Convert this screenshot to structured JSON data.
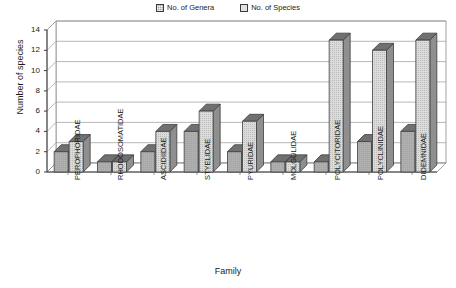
{
  "chart_data": {
    "type": "bar",
    "title": "",
    "xlabel": "Family",
    "ylabel": "Number of species",
    "ylim": [
      0,
      14
    ],
    "ytick_step": 2,
    "yticks": [
      0,
      2,
      4,
      6,
      8,
      10,
      12,
      14
    ],
    "grid": true,
    "three_d": true,
    "legend_position": "top-right",
    "categories": [
      "PEROPHORIDAE",
      "RHODOSOMATIDAE",
      "ASCIDIIDAE",
      "STYELIDAE",
      "PYURIDAE",
      "MOLGULIDAE",
      "POLYCITORIDAE",
      "POLYCLINIDAE",
      "DIDEMNIDAE"
    ],
    "series": [
      {
        "name": "No. of Genera",
        "color": "#a6a6a6",
        "pattern": "cross-hatch",
        "values": [
          2,
          1,
          2,
          4,
          2,
          1,
          1,
          3,
          4
        ]
      },
      {
        "name": "No. of Species",
        "color": "#dcdcdc",
        "pattern": "stipple",
        "values": [
          3,
          1,
          4,
          6,
          5,
          1,
          13,
          12,
          13
        ]
      }
    ]
  },
  "legend": {
    "items": [
      {
        "label": "No. of Genera"
      },
      {
        "label": "No. of Species"
      }
    ]
  },
  "axes": {
    "x_title": "Family",
    "y_title": "Number of species"
  }
}
